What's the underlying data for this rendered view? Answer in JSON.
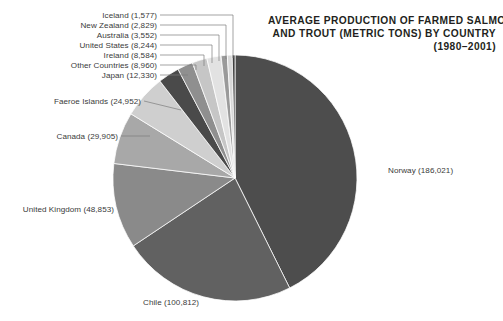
{
  "title": {
    "line1": "AVERAGE PRODUCTION OF FARMED SALMON",
    "line2": "AND TROUT (METRIC TONS) BY COUNTRY",
    "line3": "(1980–2001)"
  },
  "chart_data": {
    "type": "pie",
    "unit": "metric tons",
    "period": "1980–2001",
    "total": 338595,
    "legend": "none",
    "grid": false,
    "start_angle_deg": 0,
    "direction": "clockwise",
    "categories": [
      "Norway",
      "Chile",
      "United Kingdom",
      "Canada",
      "Faeroe Islands",
      "Japan",
      "Other Countries",
      "Ireland",
      "United States",
      "Australia",
      "New Zealand",
      "Iceland"
    ],
    "values": [
      186021,
      100812,
      48853,
      29905,
      24952,
      12330,
      8960,
      8584,
      8244,
      3552,
      2829,
      1577
    ],
    "slices": [
      {
        "name": "Norway",
        "value": 186021,
        "label": "Norway (186,021)",
        "color": "#4d4d4d"
      },
      {
        "name": "Chile",
        "value": 100812,
        "label": "Chile (100,812)",
        "color": "#616161"
      },
      {
        "name": "United Kingdom",
        "value": 48853,
        "label": "United Kingdom (48,853)",
        "color": "#8a8a8a"
      },
      {
        "name": "Canada",
        "value": 29905,
        "label": "Canada (29,905)",
        "color": "#a8a8a8"
      },
      {
        "name": "Faeroe Islands",
        "value": 24952,
        "label": "Faeroe Islands (24,952)",
        "color": "#cfcfcf"
      },
      {
        "name": "Japan",
        "value": 12330,
        "label": "Japan (12,330)",
        "color": "#4a4a4a"
      },
      {
        "name": "Other Countries",
        "value": 8960,
        "label": "Other Countries (8,960)",
        "color": "#8f8f8f"
      },
      {
        "name": "Ireland",
        "value": 8584,
        "label": "Ireland (8,584)",
        "color": "#c6c6c6"
      },
      {
        "name": "United States",
        "value": 8244,
        "label": "United States (8,244)",
        "color": "#e2e2e2"
      },
      {
        "name": "Australia",
        "value": 3552,
        "label": "Australia (3,552)",
        "color": "#9a9a9a"
      },
      {
        "name": "New Zealand",
        "value": 2829,
        "label": "New Zealand (2,829)",
        "color": "#d8d8d8"
      },
      {
        "name": "Iceland",
        "value": 1577,
        "label": "Iceland (1,577)",
        "color": "#404040"
      }
    ]
  },
  "labels": {
    "iceland": "Iceland (1,577)",
    "new_zealand": "New Zealand (2,829)",
    "australia": "Australia (3,552)",
    "united_states": "United States (8,244)",
    "ireland": "Ireland (8,584)",
    "other_countries": "Other Countries (8,960)",
    "japan": "Japan (12,330)",
    "faeroe_islands": "Faeroe Islands (24,952)",
    "canada": "Canada (29,905)",
    "united_kingdom": "United Kingdom (48,853)",
    "chile": "Chile (100,812)",
    "norway": "Norway (186,021)"
  }
}
